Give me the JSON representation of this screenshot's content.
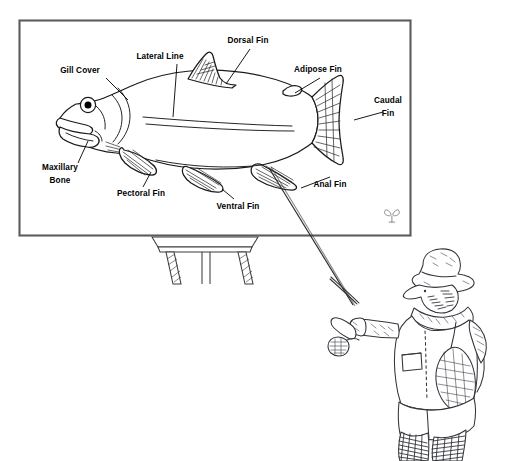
{
  "figure": {
    "background_color": "#ffffff",
    "ink_color": "#1a1a1a"
  },
  "panel": {
    "name": "diagram-panel",
    "frame_color": "#5c5c5c",
    "fill_color": "#ffffff",
    "signature_label": "artist-monogram"
  },
  "labels": [
    {
      "id": "gill-cover",
      "text": "Gill Cover",
      "lines": [
        "Gill Cover"
      ],
      "x": 80,
      "y": 73
    },
    {
      "id": "lateral-line",
      "text": "Lateral Line",
      "lines": [
        "Lateral Line"
      ],
      "x": 160,
      "y": 59
    },
    {
      "id": "dorsal-fin",
      "text": "Dorsal Fin",
      "lines": [
        "Dorsal Fin"
      ],
      "x": 248,
      "y": 43
    },
    {
      "id": "adipose-fin",
      "text": "Adipose Fin",
      "lines": [
        "Adipose Fin"
      ],
      "x": 318,
      "y": 72
    },
    {
      "id": "caudal-fin",
      "text": "Caudal Fin",
      "lines": [
        "Caudal",
        "Fin"
      ],
      "x": 388,
      "y": 103
    },
    {
      "id": "anal-fin",
      "text": "Anal Fin",
      "lines": [
        "Anal Fin"
      ],
      "x": 330,
      "y": 183
    },
    {
      "id": "ventral-fin",
      "text": "Ventral Fin",
      "lines": [
        "Ventral Fin"
      ],
      "x": 238,
      "y": 205
    },
    {
      "id": "pectoral-fin",
      "text": "Pectoral Fin",
      "lines": [
        "Pectoral Fin"
      ],
      "x": 141,
      "y": 194
    },
    {
      "id": "maxillary-bone",
      "text": "Maxillary Bone",
      "lines": [
        "Maxillary",
        "Bone"
      ],
      "x": 60,
      "y": 170
    }
  ],
  "easel": {
    "name": "easel-stand",
    "parts": [
      "tray",
      "left-leg",
      "right-leg",
      "center-post"
    ]
  },
  "fisherman": {
    "name": "fly-fisherman",
    "parts": [
      "brimmed-hat",
      "hat-band",
      "bearded-face",
      "scarf",
      "wading-jacket",
      "jacket-pocket",
      "rolled-sleeve",
      "gloved-hand",
      "fly-rod",
      "fly-reel",
      "landing-net",
      "chest-waders",
      "wading-boots"
    ]
  },
  "fishing_line": {
    "name": "fishing-line",
    "from": "anal-fin-region",
    "to": "rod-tip"
  }
}
